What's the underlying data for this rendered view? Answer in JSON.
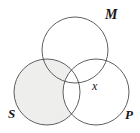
{
  "figure": {
    "type": "venn-diagram-three-sets",
    "background_color": "#ffffff",
    "stroke_color": "#4d4d4d",
    "shade_color": "#eeeeec",
    "label_color": "#161616"
  },
  "labels": {
    "set_top": "M",
    "set_left": "S",
    "set_right": "P",
    "element_marker": "x"
  },
  "circles": [
    {
      "name": "M",
      "cx": 75,
      "cy": 50,
      "r": 33,
      "filled": false
    },
    {
      "name": "S",
      "cx": 47,
      "cy": 92,
      "r": 33,
      "filled": true
    },
    {
      "name": "P",
      "cx": 96,
      "cy": 92,
      "r": 33,
      "filled": false
    }
  ],
  "shading": {
    "region": "S minus P",
    "color": "#eeeeec"
  },
  "markers": [
    {
      "text": "x",
      "x": 97,
      "y": 87,
      "region": "P only"
    }
  ]
}
